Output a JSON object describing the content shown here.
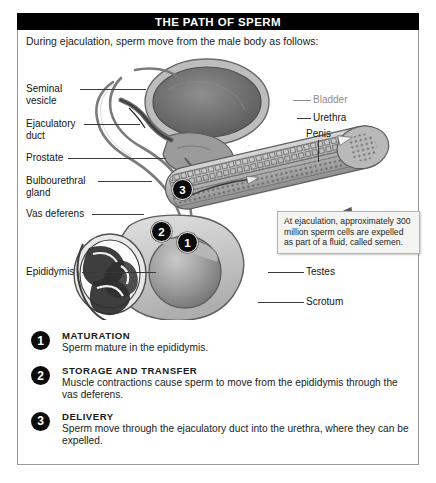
{
  "figure": {
    "title": "THE PATH OF SPERM",
    "intro": "During ejaculation, sperm move from the male body as follows:"
  },
  "labels": {
    "seminal_vesicle": "Seminal\nvesicle",
    "ejaculatory_duct": "Ejaculatory\nduct",
    "prostate": "Prostate",
    "bulbourethral_gland": "Bulbourethral\ngland",
    "vas_deferens": "Vas deferens",
    "epididymis": "Epididymis",
    "bladder": "Bladder",
    "urethra": "Urethra",
    "penis": "Penis",
    "testes": "Testes",
    "scrotum": "Scrotum"
  },
  "diagram_badges": [
    {
      "num": "3"
    },
    {
      "num": "2"
    },
    {
      "num": "1"
    }
  ],
  "callout": {
    "text": "At ejaculation, approximately 300 million sperm cells are expelled as part of a fluid, called semen."
  },
  "steps": [
    {
      "num": "1",
      "title": "MATURATION",
      "body": "Sperm mature in the epididymis."
    },
    {
      "num": "2",
      "title": "STORAGE AND TRANSFER",
      "body": "Muscle contractions cause sperm to move from the epididymis through the vas deferens."
    },
    {
      "num": "3",
      "title": "DELIVERY",
      "body": "Sperm move through the ejaculatory duct into the urethra, where they can be expelled."
    }
  ],
  "colors": {
    "title_bar": "#000000",
    "frame_border": "#9a9a9a",
    "badge_fill": "#0b0b0b",
    "callout_bg": "#f4f4f2",
    "muted_label": "#8d8d8d"
  }
}
